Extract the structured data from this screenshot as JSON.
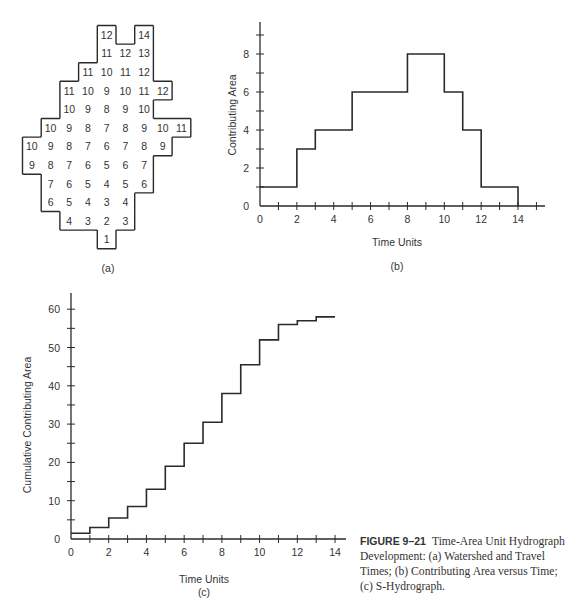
{
  "figure": {
    "number": "FIGURE 9–21",
    "caption": "Time-Area Unit Hydrograph Development: (a) Watershed and Travel Times; (b) Contributing Area versus Time; (c) S-Hydrograph."
  },
  "panel_a": {
    "label": "(a)",
    "title": "Watershed and Travel Times",
    "grid": [
      {
        "row": 0,
        "cells": [
          [
            4,
            12
          ],
          [
            6,
            14
          ]
        ]
      },
      {
        "row": 1,
        "cells": [
          [
            4,
            11
          ],
          [
            5,
            12
          ],
          [
            6,
            13
          ]
        ]
      },
      {
        "row": 2,
        "cells": [
          [
            3,
            11
          ],
          [
            4,
            10
          ],
          [
            5,
            11
          ],
          [
            6,
            12
          ]
        ]
      },
      {
        "row": 3,
        "cells": [
          [
            2,
            11
          ],
          [
            3,
            10
          ],
          [
            4,
            9
          ],
          [
            5,
            10
          ],
          [
            6,
            11
          ],
          [
            7,
            12
          ]
        ]
      },
      {
        "row": 4,
        "cells": [
          [
            2,
            10
          ],
          [
            3,
            9
          ],
          [
            4,
            8
          ],
          [
            5,
            9
          ],
          [
            6,
            10
          ]
        ]
      },
      {
        "row": 5,
        "cells": [
          [
            1,
            10
          ],
          [
            2,
            9
          ],
          [
            3,
            8
          ],
          [
            4,
            7
          ],
          [
            5,
            8
          ],
          [
            6,
            9
          ],
          [
            7,
            10
          ],
          [
            8,
            11
          ]
        ]
      },
      {
        "row": 6,
        "cells": [
          [
            0,
            10
          ],
          [
            1,
            9
          ],
          [
            2,
            8
          ],
          [
            3,
            7
          ],
          [
            4,
            6
          ],
          [
            5,
            7
          ],
          [
            6,
            8
          ],
          [
            7,
            9
          ]
        ]
      },
      {
        "row": 7,
        "cells": [
          [
            0,
            9
          ],
          [
            1,
            8
          ],
          [
            2,
            7
          ],
          [
            3,
            6
          ],
          [
            4,
            5
          ],
          [
            5,
            6
          ],
          [
            6,
            7
          ]
        ]
      },
      {
        "row": 8,
        "cells": [
          [
            1,
            7
          ],
          [
            2,
            6
          ],
          [
            3,
            5
          ],
          [
            4,
            4
          ],
          [
            5,
            5
          ],
          [
            6,
            6
          ]
        ]
      },
      {
        "row": 9,
        "cells": [
          [
            1,
            6
          ],
          [
            2,
            5
          ],
          [
            3,
            4
          ],
          [
            4,
            3
          ],
          [
            5,
            4
          ]
        ]
      },
      {
        "row": 10,
        "cells": [
          [
            2,
            4
          ],
          [
            3,
            3
          ],
          [
            4,
            2
          ],
          [
            5,
            3
          ]
        ]
      },
      {
        "row": 11,
        "cells": [
          [
            4,
            1
          ]
        ]
      }
    ]
  },
  "chart_data": [
    {
      "panel": "(b)",
      "type": "line",
      "style": "step",
      "title": "Contributing Area versus Time",
      "xlabel": "Time Units",
      "ylabel": "Contributing Area",
      "xlim": [
        0,
        15
      ],
      "ylim": [
        0,
        9
      ],
      "x_tick_labels": [
        "0",
        "2",
        "4",
        "6",
        "8",
        "10",
        "12",
        "14"
      ],
      "y_tick_labels": [
        "0",
        "2",
        "4",
        "6",
        "8"
      ],
      "grid": false,
      "x": [
        0,
        1,
        2,
        3,
        4,
        5,
        6,
        7,
        8,
        9,
        10,
        11,
        12,
        13,
        14
      ],
      "series": [
        {
          "name": "Contributing Area",
          "values": [
            1,
            1,
            3,
            4,
            4,
            6,
            6,
            6,
            8,
            8,
            6,
            4,
            1,
            1
          ]
        }
      ]
    },
    {
      "panel": "(c)",
      "type": "line",
      "style": "step",
      "title": "S-Hydrograph",
      "xlabel": "Time Units",
      "ylabel": "Cumulative Contributing Area",
      "xlim": [
        0,
        14.5
      ],
      "ylim": [
        0,
        62
      ],
      "x_tick_labels": [
        "0",
        "2",
        "4",
        "6",
        "8",
        "10",
        "12",
        "14"
      ],
      "y_tick_labels": [
        "0",
        "10",
        "20",
        "30",
        "40",
        "50",
        "60"
      ],
      "grid": false,
      "x": [
        0,
        1,
        2,
        3,
        4,
        5,
        6,
        7,
        8,
        9,
        10,
        11,
        12,
        13,
        14
      ],
      "series": [
        {
          "name": "Cumulative Contributing Area",
          "values": [
            1.5,
            3,
            5.5,
            8.5,
            13,
            19,
            25,
            30.5,
            38,
            45.5,
            52,
            56,
            57,
            58
          ]
        }
      ]
    }
  ],
  "labels": {
    "b_panel": "(b)",
    "c_panel": "(c)",
    "b_xlabel": "Time Units",
    "b_ylabel": "Contributing Area",
    "c_xlabel": "Time Units",
    "c_ylabel": "Cumulative Contributing Area"
  },
  "colors": {
    "line": "#2a2a2a",
    "text": "#333333",
    "background": "#ffffff"
  }
}
